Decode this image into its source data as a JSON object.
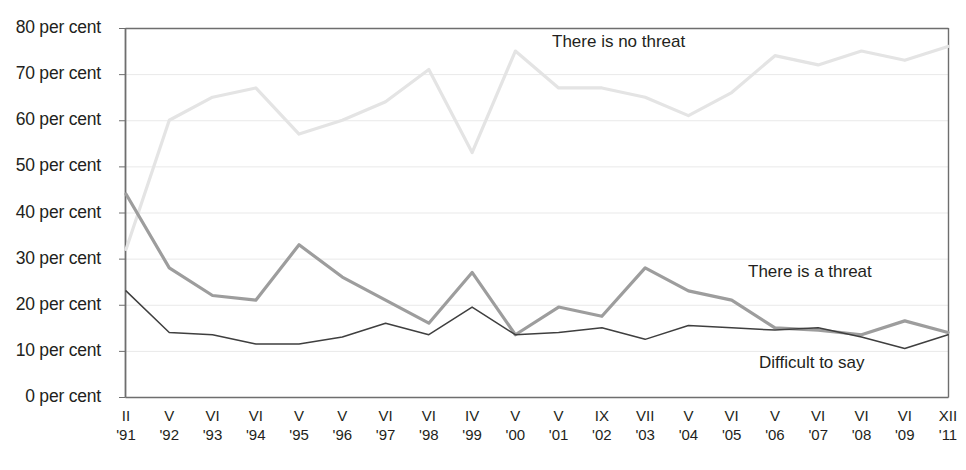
{
  "chart_data": {
    "type": "line",
    "title": "",
    "subtitle": "",
    "xlabel": "",
    "ylabel": "",
    "ylim": [
      0,
      80
    ],
    "ytick_step": 10,
    "grid": true,
    "legend_position": "inline-annotations",
    "unit_suffix": "per cent",
    "ytick_labels": [
      "80 per cent",
      "70 per cent",
      "60 per cent",
      "50 per cent",
      "40 per cent",
      "30 per cent",
      "20 per cent",
      "10 per cent",
      "0 per cent"
    ],
    "ytick_values": [
      80,
      70,
      60,
      50,
      40,
      30,
      20,
      10,
      0
    ],
    "categories": [
      "II '91",
      "V '92",
      "VI '93",
      "VI '94",
      "V '95",
      "V '96",
      "VI '97",
      "VI '98",
      "IV '99",
      "V '00",
      "V '01",
      "IX '02",
      "VII '03",
      "V '04",
      "VI '05",
      "V '06",
      "VI '07",
      "VI '08",
      "VI '09",
      "XII '11"
    ],
    "xtick_months": [
      "II",
      "V",
      "VI",
      "VI",
      "V",
      "V",
      "VI",
      "VI",
      "IV",
      "V",
      "V",
      "IX",
      "VII",
      "V",
      "VI",
      "V",
      "VI",
      "VI",
      "VI",
      "XII"
    ],
    "xtick_years": [
      "'91",
      "'92",
      "'93",
      "'94",
      "'95",
      "'96",
      "'97",
      "'98",
      "'99",
      "'00",
      "'01",
      "'02",
      "'03",
      "'04",
      "'05",
      "'06",
      "'07",
      "'08",
      "'09",
      "'11"
    ],
    "series": [
      {
        "name": "There is no threat",
        "color": "#e4e4e4",
        "width": 3.2,
        "label_x": 552,
        "label_y": 32,
        "values": [
          32,
          60,
          65,
          67,
          57,
          60,
          64,
          71,
          53,
          75,
          67,
          67,
          65,
          61,
          66,
          74,
          72,
          75,
          73,
          76
        ]
      },
      {
        "name": "There is a threat",
        "color": "#9d9d9d",
        "width": 3.2,
        "label_x": 748,
        "label_y": 262,
        "values": [
          44,
          28,
          22,
          21,
          33,
          26,
          21,
          16,
          27,
          13.5,
          19.5,
          17.5,
          28,
          23,
          21,
          15,
          14.5,
          13.5,
          16.5,
          14
        ]
      },
      {
        "name": "Difficult to say",
        "color": "#3f3f3f",
        "width": 1.5,
        "label_x": 759,
        "label_y": 353,
        "values": [
          23,
          14,
          13.5,
          11.5,
          11.5,
          13,
          16,
          13.5,
          19.5,
          13.5,
          14,
          15,
          12.5,
          15.5,
          15,
          14.5,
          15,
          13,
          10.5,
          13.5
        ]
      }
    ],
    "axis": {
      "plot_left": 126,
      "plot_right": 948,
      "plot_top": 28,
      "plot_bottom": 397,
      "axis_color": "#6e6e6e",
      "grid_color": "#e9e9e9"
    }
  }
}
